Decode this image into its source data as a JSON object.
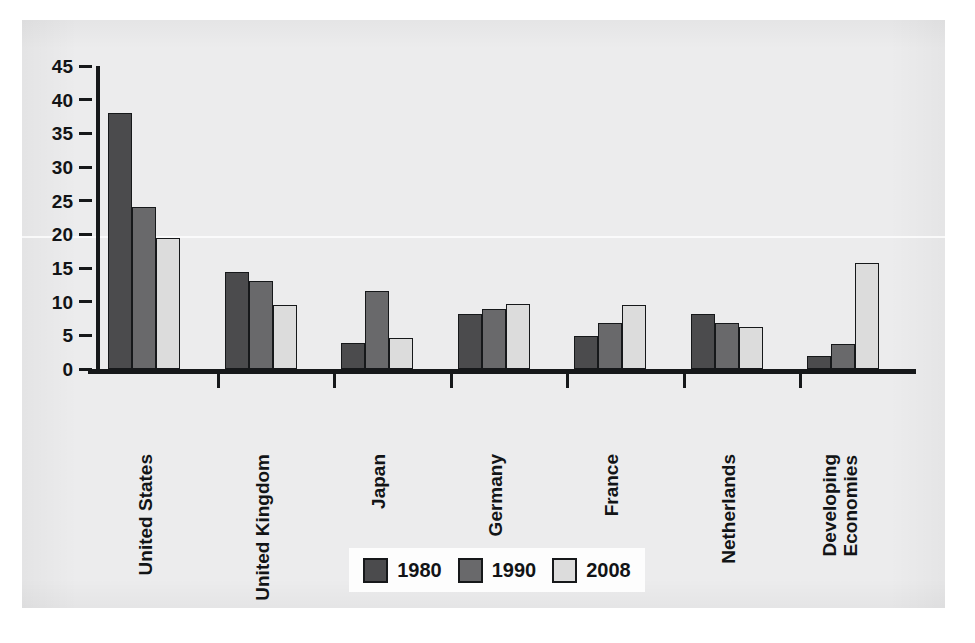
{
  "chart_data": {
    "type": "bar",
    "title": "",
    "subtitle": "",
    "xlabel": "",
    "ylabel": "",
    "ylim": [
      0,
      45
    ],
    "yticks": [
      0,
      5,
      10,
      15,
      20,
      25,
      30,
      35,
      40,
      45
    ],
    "grid": false,
    "legend_position": "bottom-center",
    "categories": [
      "United States",
      "United Kingdom",
      "Japan",
      "Germany",
      "France",
      "Netherlands",
      "Developing Economies"
    ],
    "series": [
      {
        "name": "1980",
        "color": "#4b4b4d",
        "values": [
          38.0,
          14.4,
          3.9,
          8.1,
          4.9,
          8.2,
          2.0
        ]
      },
      {
        "name": "1990",
        "color": "#69696b",
        "values": [
          24.1,
          13.0,
          11.6,
          8.9,
          6.9,
          6.9,
          3.7
        ]
      },
      {
        "name": "2008",
        "color": "#dcdcdc",
        "values": [
          19.5,
          9.5,
          4.6,
          9.6,
          9.5,
          6.3,
          15.7
        ]
      }
    ]
  },
  "axis": {
    "tick_labels": [
      "45",
      "40",
      "35",
      "30",
      "25",
      "20",
      "15",
      "10",
      "5",
      "0"
    ]
  },
  "legend": {
    "items": [
      {
        "label": "1980",
        "color": "#4b4b4d"
      },
      {
        "label": "1990",
        "color": "#69696b"
      },
      {
        "label": "2008",
        "color": "#dcdcdc"
      }
    ]
  },
  "categories_display": [
    {
      "line1": "United States",
      "line2": ""
    },
    {
      "line1": "United Kingdom",
      "line2": ""
    },
    {
      "line1": "Japan",
      "line2": ""
    },
    {
      "line1": "Germany",
      "line2": ""
    },
    {
      "line1": "France",
      "line2": ""
    },
    {
      "line1": "Netherlands",
      "line2": ""
    },
    {
      "line1": "Developing",
      "line2": "Economies"
    }
  ]
}
